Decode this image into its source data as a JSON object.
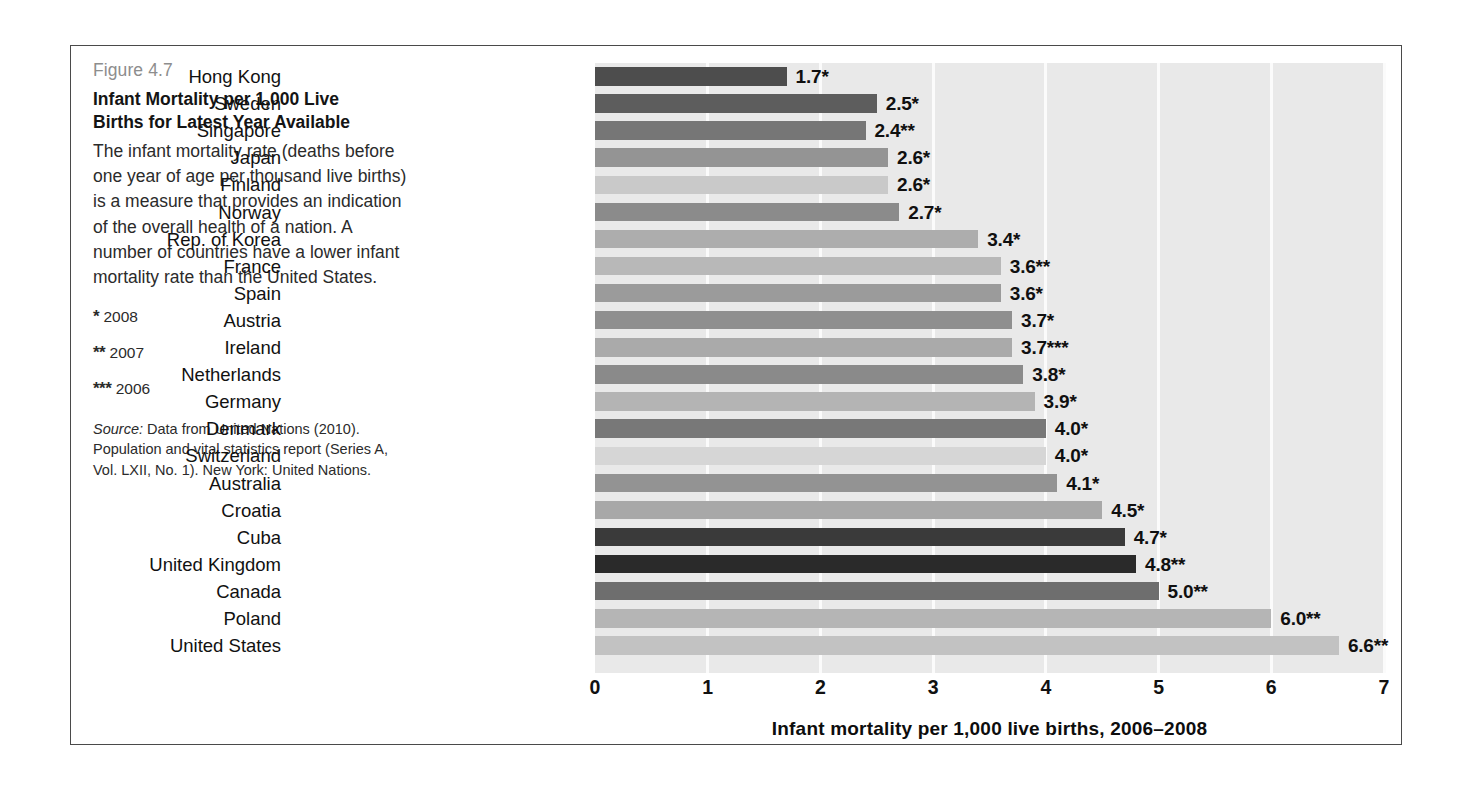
{
  "figure": {
    "number": "Figure 4.7",
    "title": "Infant Mortality per 1,000 Live Births for Latest Year Available",
    "description": "The infant mortality rate (deaths before one year of age per thousand live births) is a measure that provides an indication of the overall health of a nation. A number of countries have a lower infant mortality rate than the United States.",
    "footnotes": [
      {
        "marker": "*",
        "text": "2008"
      },
      {
        "marker": "**",
        "text": "2007"
      },
      {
        "marker": "***",
        "text": "2006"
      }
    ],
    "source_label": "Source:",
    "source_text": " Data from United Nations (2010). Population and vital statistics report (Series A, Vol. LXII, No. 1). New York: United Nations."
  },
  "chart_data": {
    "type": "bar",
    "orientation": "horizontal",
    "title": "Infant Mortality per 1,000 Live Births for Latest Year Available",
    "xlabel": "Infant mortality per 1,000 live births, 2006–2008",
    "ylabel": "",
    "xlim": [
      0,
      7
    ],
    "xticks": [
      0,
      1,
      2,
      3,
      4,
      5,
      6,
      7
    ],
    "xtick_labels": [
      "0",
      "1",
      "2",
      "3",
      "4",
      "5",
      "6",
      "7"
    ],
    "grid": "vertical",
    "legend": "none",
    "plot_background": "#e9e9e9",
    "gridline_color": "#fbfbfb",
    "categories": [
      "Hong Kong",
      "Sweden",
      "Singapore",
      "Japan",
      "Finland",
      "Norway",
      "Rep. of Korea",
      "France",
      "Spain",
      "Austria",
      "Ireland",
      "Netherlands",
      "Germany",
      "Denmark",
      "Switzerland",
      "Australia",
      "Croatia",
      "Cuba",
      "United Kingdom",
      "Canada",
      "Poland",
      "United States"
    ],
    "values": [
      1.7,
      2.5,
      2.4,
      2.6,
      2.6,
      2.7,
      3.4,
      3.6,
      3.6,
      3.7,
      3.7,
      3.8,
      3.9,
      4.0,
      4.0,
      4.1,
      4.5,
      4.7,
      4.8,
      5.0,
      6.0,
      6.6
    ],
    "data_labels": [
      "1.7*",
      "2.5*",
      "2.4**",
      "2.6*",
      "2.6*",
      "2.7*",
      "3.4*",
      "3.6**",
      "3.6*",
      "3.7*",
      "3.7***",
      "3.8*",
      "3.9*",
      "4.0*",
      "4.0*",
      "4.1*",
      "4.5*",
      "4.7*",
      "4.8**",
      "5.0**",
      "6.0**",
      "6.6**"
    ],
    "bar_colors": [
      "#4d4d4d",
      "#5d5d5d",
      "#767676",
      "#949494",
      "#c9c9c9",
      "#8b8b8b",
      "#adadad",
      "#b8b8b8",
      "#9b9b9b",
      "#8f8f8f",
      "#aaaaaa",
      "#8a8a8a",
      "#b4b4b4",
      "#787878",
      "#d6d6d6",
      "#939393",
      "#a8a8a8",
      "#3a3a3a",
      "#2a2a2a",
      "#6e6e6e",
      "#b5b5b5",
      "#c2c2c2"
    ],
    "rows": [
      {
        "category": "Hong Kong",
        "value": 1.7,
        "label": "1.7*",
        "year_marker": "*",
        "color": "#4d4d4d"
      },
      {
        "category": "Sweden",
        "value": 2.5,
        "label": "2.5*",
        "year_marker": "*",
        "color": "#5d5d5d"
      },
      {
        "category": "Singapore",
        "value": 2.4,
        "label": "2.4**",
        "year_marker": "**",
        "color": "#767676"
      },
      {
        "category": "Japan",
        "value": 2.6,
        "label": "2.6*",
        "year_marker": "*",
        "color": "#949494"
      },
      {
        "category": "Finland",
        "value": 2.6,
        "label": "2.6*",
        "year_marker": "*",
        "color": "#c9c9c9"
      },
      {
        "category": "Norway",
        "value": 2.7,
        "label": "2.7*",
        "year_marker": "*",
        "color": "#8b8b8b"
      },
      {
        "category": "Rep. of Korea",
        "value": 3.4,
        "label": "3.4*",
        "year_marker": "*",
        "color": "#adadad"
      },
      {
        "category": "France",
        "value": 3.6,
        "label": "3.6**",
        "year_marker": "**",
        "color": "#b8b8b8"
      },
      {
        "category": "Spain",
        "value": 3.6,
        "label": "3.6*",
        "year_marker": "*",
        "color": "#9b9b9b"
      },
      {
        "category": "Austria",
        "value": 3.7,
        "label": "3.7*",
        "year_marker": "*",
        "color": "#8f8f8f"
      },
      {
        "category": "Ireland",
        "value": 3.7,
        "label": "3.7***",
        "year_marker": "***",
        "color": "#aaaaaa"
      },
      {
        "category": "Netherlands",
        "value": 3.8,
        "label": "3.8*",
        "year_marker": "*",
        "color": "#8a8a8a"
      },
      {
        "category": "Germany",
        "value": 3.9,
        "label": "3.9*",
        "year_marker": "*",
        "color": "#b4b4b4"
      },
      {
        "category": "Denmark",
        "value": 4.0,
        "label": "4.0*",
        "year_marker": "*",
        "color": "#787878"
      },
      {
        "category": "Switzerland",
        "value": 4.0,
        "label": "4.0*",
        "year_marker": "*",
        "color": "#d6d6d6"
      },
      {
        "category": "Australia",
        "value": 4.1,
        "label": "4.1*",
        "year_marker": "*",
        "color": "#939393"
      },
      {
        "category": "Croatia",
        "value": 4.5,
        "label": "4.5*",
        "year_marker": "*",
        "color": "#a8a8a8"
      },
      {
        "category": "Cuba",
        "value": 4.7,
        "label": "4.7*",
        "year_marker": "*",
        "color": "#3a3a3a"
      },
      {
        "category": "United Kingdom",
        "value": 4.8,
        "label": "4.8**",
        "year_marker": "**",
        "color": "#2a2a2a"
      },
      {
        "category": "Canada",
        "value": 5.0,
        "label": "5.0**",
        "year_marker": "**",
        "color": "#6e6e6e"
      },
      {
        "category": "Poland",
        "value": 6.0,
        "label": "6.0**",
        "year_marker": "**",
        "color": "#b5b5b5"
      },
      {
        "category": "United States",
        "value": 6.6,
        "label": "6.6**",
        "year_marker": "**",
        "color": "#c2c2c2"
      }
    ]
  }
}
